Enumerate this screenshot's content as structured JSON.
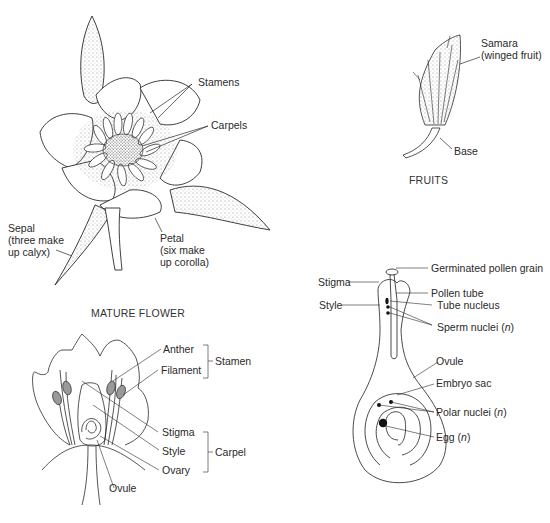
{
  "mature_flower": {
    "caption": "MATURE FLOWER",
    "labels": {
      "stamens": "Stamens",
      "carpels": "Carpels",
      "sepal": [
        "Sepal",
        "(three make",
        "up calyx)"
      ],
      "petal": [
        "Petal",
        "(six make",
        "up corolla)"
      ]
    }
  },
  "fruits": {
    "caption": "FRUITS",
    "labels": {
      "samara": [
        "Samara",
        "(winged fruit)"
      ],
      "base": "Base"
    }
  },
  "flower_section": {
    "labels": {
      "anther": "Anther",
      "filament": "Filament",
      "stamen_group": "Stamen",
      "stigma": "Stigma",
      "style": "Style",
      "ovary": "Ovary",
      "carpel_group": "Carpel",
      "ovule": "Ovule"
    }
  },
  "fertilization": {
    "labels": {
      "germinated_pollen_grain": "Germinated pollen grain",
      "stigma": "Stigma",
      "pollen_tube": "Pollen tube",
      "style": "Style",
      "tube_nucleus": "Tube nucleus",
      "sperm_nuclei": "Sperm nuclei (",
      "sperm_nuclei_n": "n",
      "ovule": "Ovule",
      "embryo_sac": "Embryo sac",
      "polar_nuclei": "Polar nuclei (",
      "polar_nuclei_n": "n",
      "egg": "Egg (",
      "egg_n": "n",
      "close_paren": ")"
    }
  },
  "colors": {
    "ink": "#2a2a2a",
    "stipple": "#888888",
    "anther_fill": "#9a9a9a"
  }
}
